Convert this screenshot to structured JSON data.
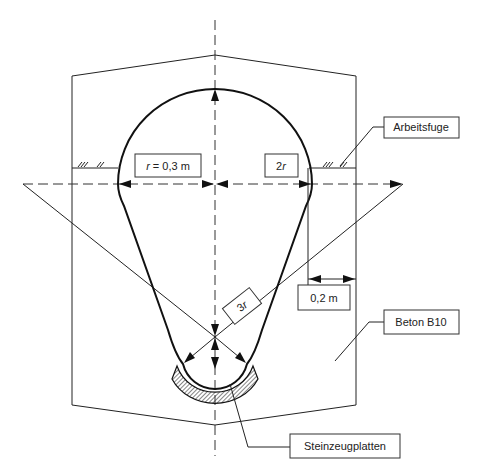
{
  "diagram": {
    "type": "cross-section",
    "labels": {
      "radius": "r = 0,3 m",
      "radius_var": "r",
      "radius_rest": " = 0,3 m",
      "double_radius": "2r",
      "double_radius_num": "2",
      "double_radius_var": "r",
      "triple_radius": "3r",
      "triple_radius_num": "3",
      "triple_radius_var": "r",
      "wall_thickness": "0,2 m",
      "construction_joint": "Arbeitsfuge",
      "concrete": "Beton B10",
      "lining": "Steinzeugplatten"
    },
    "colors": {
      "line": "#111111",
      "box_border": "#333333",
      "hatch": "#444444",
      "background": "#ffffff"
    }
  }
}
